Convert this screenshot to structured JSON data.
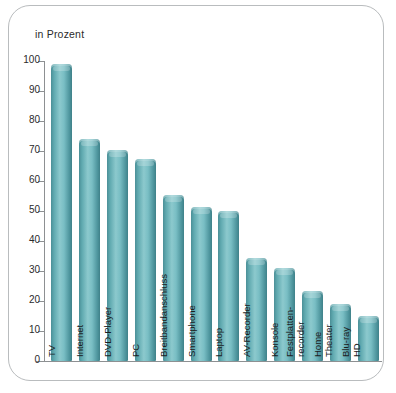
{
  "card": {
    "axis_title": "in Prozent"
  },
  "chart_data": {
    "type": "bar",
    "title": "",
    "subtitle": "",
    "xlabel": "",
    "ylabel": "in Prozent",
    "ylim": [
      0,
      100
    ],
    "grid": false,
    "legend": null,
    "orientation": "vertical",
    "bar_color": "#6cb5bb",
    "bar_color_edge": "#3f8189",
    "bar_color_highlight": "#8cc9cd",
    "yticks": [
      0,
      10,
      20,
      30,
      40,
      50,
      60,
      70,
      80,
      90,
      100
    ],
    "ytick_labels": [
      "0",
      "10",
      "20",
      "30",
      "40",
      "50",
      "60",
      "70",
      "80",
      "90",
      "100"
    ],
    "categories": [
      "TV",
      "Internet",
      "DVD-Player",
      "PC",
      "Breitbandanschluss",
      "Smartphone",
      "Laptop",
      "AV-Recorder",
      "Konsole",
      "Festplatten-recorder",
      "Home Theater",
      "Blu-ray HD"
    ],
    "category_lines": [
      [
        "TV"
      ],
      [
        "Internet"
      ],
      [
        "DVD-Player"
      ],
      [
        "PC"
      ],
      [
        "Breitbandanschluss"
      ],
      [
        "Smartphone"
      ],
      [
        "Laptop"
      ],
      [
        "AV-Recorder"
      ],
      [
        "Konsole"
      ],
      [
        "Festplatten-",
        "recorder"
      ],
      [
        "Home",
        "Theater"
      ],
      [
        "Blu-ray",
        "HD"
      ]
    ],
    "values": [
      99,
      74,
      70.5,
      67.5,
      55.5,
      51.5,
      50,
      34.5,
      31,
      23.5,
      19,
      15
    ]
  }
}
